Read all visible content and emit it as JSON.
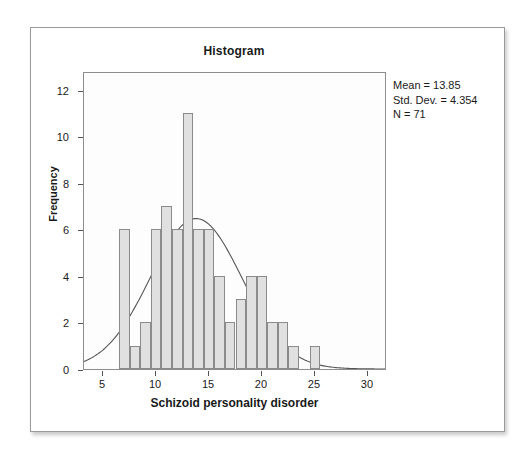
{
  "chart_data": {
    "type": "bar",
    "title": "Histogram",
    "xlabel": "Schizoid personality disorder",
    "ylabel": "Frequency",
    "xlim": [
      3.2,
      31.8
    ],
    "ylim": [
      0,
      12.8
    ],
    "xticks": [
      5,
      10,
      15,
      20,
      25,
      30
    ],
    "yticks": [
      0,
      2,
      4,
      6,
      8,
      10,
      12
    ],
    "grid": false,
    "legend": "none",
    "bin_width": 1,
    "bin_starts": [
      6.5,
      7.5,
      8.5,
      9.5,
      10.5,
      11.5,
      12.5,
      13.5,
      14.5,
      15.5,
      16.5,
      17.5,
      18.5,
      19.5,
      20.5,
      21.5,
      22.5,
      24.5
    ],
    "categories": [
      "7",
      "8",
      "9",
      "10",
      "11",
      "12",
      "13",
      "14",
      "15",
      "16",
      "17",
      "18",
      "19",
      "20",
      "21",
      "22",
      "23",
      "25"
    ],
    "values": [
      6,
      1,
      2,
      6,
      7,
      6,
      11,
      6,
      6,
      4,
      2,
      3,
      4,
      4,
      2,
      2,
      1,
      1
    ],
    "overlay": {
      "type": "normal-curve",
      "mean": 13.85,
      "std_dev": 4.354,
      "n": 71,
      "scale_note": "normal density scaled to bin width 1 times N"
    }
  },
  "statistics": {
    "mean_label": "Mean = 13.85",
    "std_dev_label": "Std. Dev. = 4.354",
    "n_label": "N = 71"
  },
  "colors": {
    "bar_fill": "#e0e0e0",
    "bar_border": "#8b8b8b",
    "curve": "#555555",
    "panel_border": "#8d8d8d",
    "text": "#1a1a1a"
  }
}
